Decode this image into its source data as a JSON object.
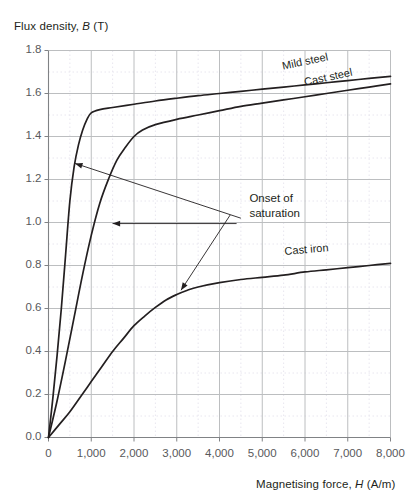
{
  "chart_data": {
    "type": "line",
    "title": "",
    "ylabel_full": "Flux density, B (T)",
    "ylabel_text_pre": "Flux density, ",
    "ylabel_symbol": "B",
    "ylabel_text_post": " (T)",
    "xlabel_full": "Magnetising force, H (A/m)",
    "xlabel_text_pre": "Magnetising force, ",
    "xlabel_symbol": "H",
    "xlabel_text_post": " (A/m)",
    "xlim": [
      0,
      8000
    ],
    "ylim": [
      0.0,
      1.8
    ],
    "x_major_step": 1000,
    "y_major_step": 0.2,
    "x_minor_step": 500,
    "y_minor_step": 0.1,
    "grid": true,
    "grid_major_color": "#bcbec0",
    "grid_minor_color": "#e8e6ef",
    "axis_color": "#808285",
    "curve_color": "#231f20",
    "legend_position": "inline-curve-labels",
    "xticklabels": [
      "0",
      "1,000",
      "2,000",
      "3,000",
      "4,000",
      "5,000",
      "6,000",
      "7,000",
      "8,000"
    ],
    "yticklabels": [
      "0.0",
      "0.2",
      "0.4",
      "0.6",
      "0.8",
      "1.0",
      "1.2",
      "1.4",
      "1.6",
      "1.8"
    ],
    "series": [
      {
        "name": "Mild steel",
        "label": "Mild steel",
        "label_rotation_deg": -12,
        "x": [
          0,
          100,
          200,
          300,
          400,
          500,
          600,
          700,
          800,
          900,
          1000,
          1200,
          1500,
          2000,
          2500,
          3000,
          3500,
          4000,
          4500,
          5000,
          5500,
          6000,
          6500,
          7000,
          7500,
          8000
        ],
        "y": [
          0.0,
          0.18,
          0.38,
          0.6,
          0.85,
          1.1,
          1.26,
          1.36,
          1.43,
          1.48,
          1.51,
          1.525,
          1.535,
          1.55,
          1.565,
          1.578,
          1.59,
          1.6,
          1.61,
          1.62,
          1.63,
          1.64,
          1.65,
          1.66,
          1.67,
          1.68
        ]
      },
      {
        "name": "Cast steel",
        "label": "Cast steel",
        "label_rotation_deg": -12,
        "x": [
          0,
          200,
          400,
          600,
          800,
          1000,
          1200,
          1400,
          1600,
          1800,
          2000,
          2200,
          2500,
          3000,
          3500,
          4000,
          4500,
          5000,
          5500,
          6000,
          6500,
          7000,
          7500,
          8000
        ],
        "y": [
          0.0,
          0.17,
          0.36,
          0.56,
          0.76,
          0.94,
          1.09,
          1.2,
          1.29,
          1.35,
          1.4,
          1.43,
          1.455,
          1.48,
          1.5,
          1.52,
          1.54,
          1.555,
          1.57,
          1.585,
          1.6,
          1.615,
          1.63,
          1.645
        ]
      },
      {
        "name": "Cast iron",
        "label": "Cast iron",
        "label_rotation_deg": -5,
        "x": [
          0,
          250,
          500,
          750,
          1000,
          1250,
          1500,
          1750,
          2000,
          2250,
          2500,
          2750,
          3000,
          3250,
          3500,
          4000,
          4500,
          5000,
          5500,
          6000,
          6500,
          7000,
          7500,
          8000
        ],
        "y": [
          0.0,
          0.06,
          0.12,
          0.19,
          0.26,
          0.33,
          0.4,
          0.46,
          0.52,
          0.565,
          0.605,
          0.64,
          0.665,
          0.685,
          0.7,
          0.72,
          0.735,
          0.745,
          0.755,
          0.77,
          0.78,
          0.79,
          0.8,
          0.81
        ]
      }
    ],
    "annotations": [
      {
        "text_line1": "Onset of",
        "text_line2": "saturation",
        "text_x": 4700,
        "text_y": 1.11,
        "arrows": [
          {
            "target_series": "Mild steel",
            "tip_x": 620,
            "tip_y": 1.275,
            "tail_x": 4500,
            "tail_y": 1.02
          },
          {
            "target_series": "Cast steel",
            "tip_x": 1500,
            "tip_y": 0.995,
            "tail_x": 4400,
            "tail_y": 0.995
          },
          {
            "target_series": "Cast iron",
            "tip_x": 3100,
            "tip_y": 0.685,
            "tail_x": 4250,
            "tail_y": 1.035
          }
        ]
      }
    ]
  }
}
